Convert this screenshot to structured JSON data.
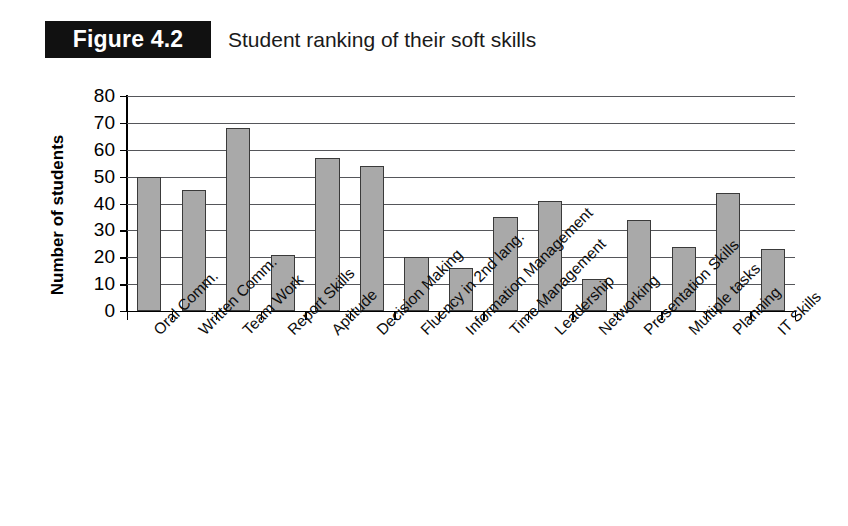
{
  "figure": {
    "badge_label": "Figure 4.2",
    "title": "Student ranking of their soft skills"
  },
  "chart_data": {
    "type": "bar",
    "title": "Student ranking of their soft skills",
    "xlabel": "",
    "ylabel": "Number of students",
    "ylim": [
      0,
      80
    ],
    "ytick_labels": [
      "80",
      "70",
      "60",
      "50",
      "40",
      "30",
      "20",
      "10",
      "0"
    ],
    "yticks": [
      80,
      70,
      60,
      50,
      40,
      30,
      20,
      10,
      0
    ],
    "grid": true,
    "legend": false,
    "bar_color": "#a9a9a9",
    "bar_border_color": "#3a3a3a",
    "categories": [
      "Oral Comm.",
      "Written Comm.",
      "Team Work",
      "Report Skills",
      "Aptitude",
      "Decision Making",
      "Fluency in 2nd lang.",
      "Information Management",
      "Time Management",
      "Leadership",
      "Networking",
      "Presentation Skills",
      "Multiple tasks",
      "Planning",
      "IT Skills"
    ],
    "values": [
      50,
      45,
      68,
      21,
      57,
      54,
      20,
      16,
      35,
      41,
      12,
      34,
      24,
      44,
      23
    ]
  }
}
